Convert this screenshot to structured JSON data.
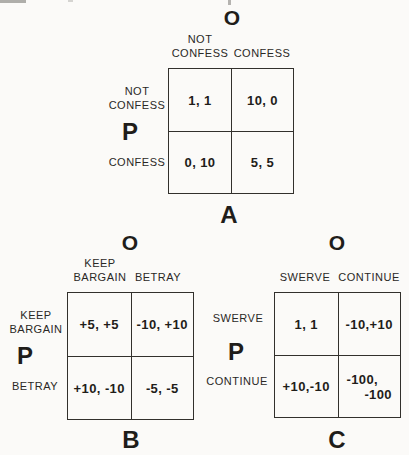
{
  "page": {
    "background": "#fbfaf8",
    "ink": "#1f1d1a"
  },
  "matrices": [
    {
      "label": "A",
      "column_player": "O",
      "row_player": "P",
      "col_headers": [
        [
          "NOT",
          "CONFESS"
        ],
        [
          "CONFESS"
        ]
      ],
      "row_headers": [
        [
          "NOT",
          "CONFESS"
        ],
        [
          "CONFESS"
        ]
      ],
      "cells": [
        [
          "1, 1"
        ],
        [
          "10, 0"
        ],
        [
          "0, 10"
        ],
        [
          "5, 5"
        ]
      ]
    },
    {
      "label": "B",
      "column_player": "O",
      "row_player": "P",
      "col_headers": [
        [
          "KEEP",
          "BARGAIN"
        ],
        [
          "BETRAY"
        ]
      ],
      "row_headers": [
        [
          "KEEP",
          "BARGAIN"
        ],
        [
          "BETRAY"
        ]
      ],
      "cells": [
        [
          "+5, +5"
        ],
        [
          "-10, +10"
        ],
        [
          "+10, -10"
        ],
        [
          "-5, -5"
        ]
      ]
    },
    {
      "label": "C",
      "column_player": "O",
      "row_player": "P",
      "col_headers": [
        [
          "SWERVE"
        ],
        [
          "CONTINUE"
        ]
      ],
      "row_headers": [
        [
          "SWERVE"
        ],
        [
          "CONTINUE"
        ]
      ],
      "cells": [
        [
          "1, 1"
        ],
        [
          "-10,+10"
        ],
        [
          "+10,-10"
        ],
        [
          "-100,",
          "-100"
        ]
      ]
    }
  ]
}
